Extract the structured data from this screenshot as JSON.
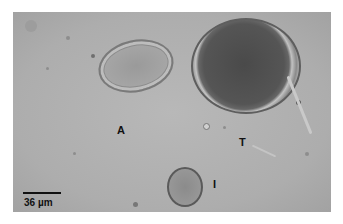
{
  "figure": {
    "type": "microscopy",
    "background_color": "#b2b2b2",
    "labels": [
      {
        "id": "A",
        "text": "A"
      },
      {
        "id": "T",
        "text": "T"
      },
      {
        "id": "I",
        "text": "I"
      }
    ],
    "scale_bar": {
      "text": "36 µm"
    }
  }
}
